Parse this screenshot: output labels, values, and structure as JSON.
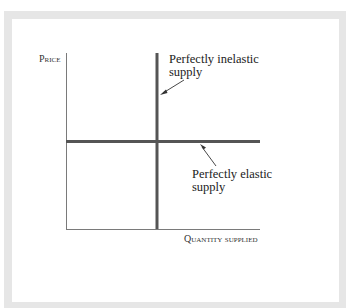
{
  "diagram": {
    "y_axis_label": "Price",
    "x_axis_label": "Quantity supplied",
    "inelastic_label_line1": "Perfectly inelastic",
    "inelastic_label_line2": "supply",
    "elastic_label_line1": "Perfectly elastic",
    "elastic_label_line2": "supply",
    "colors": {
      "frame": "#e6e6e6",
      "axis": "#7a7a7a",
      "supply_line": "#555555",
      "text": "#222222"
    },
    "curves": [
      {
        "name": "Perfectly inelastic supply",
        "orientation": "vertical"
      },
      {
        "name": "Perfectly elastic supply",
        "orientation": "horizontal"
      }
    ]
  }
}
